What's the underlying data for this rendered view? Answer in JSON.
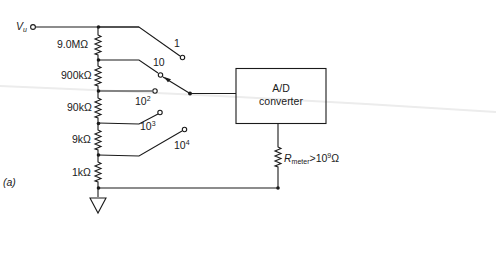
{
  "figure": {
    "panel_label": "(a)",
    "input": {
      "symbol": "V",
      "subscript": "u"
    },
    "divider_resistors": [
      "9.0MΩ",
      "900kΩ",
      "90kΩ",
      "9kΩ",
      "1kΩ"
    ],
    "switch_positions": [
      {
        "base": "1",
        "exp": ""
      },
      {
        "base": "10",
        "exp": ""
      },
      {
        "base": "10",
        "exp": "2"
      },
      {
        "base": "10",
        "exp": "3"
      },
      {
        "base": "10",
        "exp": "4"
      }
    ],
    "converter": {
      "line1": "A/D",
      "line2": "converter"
    },
    "meter_resistance": {
      "symbol": "R",
      "subscript": "meter",
      "relation": ">10",
      "exp": "9",
      "unit": "Ω"
    },
    "ground": "ground"
  },
  "colors": {
    "ink": "#1a1a1a",
    "background": "#ffffff"
  }
}
